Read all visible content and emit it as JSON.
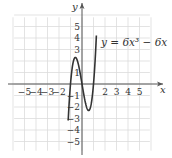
{
  "chart_data": {
    "type": "line",
    "title": "",
    "xlabel": "x",
    "ylabel": "y",
    "equation_label": "y = 6x³ − 6x",
    "function": "6x^3 - 6x",
    "xlim": [
      -6,
      6
    ],
    "ylim": [
      -6,
      6
    ],
    "grid": true,
    "x_ticks": [
      -5,
      -4,
      -3,
      -2,
      2,
      3,
      4,
      5
    ],
    "x_tick_labels": [
      "−5",
      "−4",
      "−3",
      "−2",
      "2",
      "3",
      "4",
      "5"
    ],
    "y_ticks": [
      5,
      4,
      3,
      1,
      -1,
      -2,
      -3,
      -4,
      -5
    ],
    "y_tick_labels": [
      "5",
      "4",
      "3",
      "1",
      "−1",
      "−2",
      "−3",
      "−4",
      "−5"
    ],
    "series": [
      {
        "name": "y = 6x^3 - 6x",
        "x": [
          -1.2,
          -1.1,
          -1.0,
          -0.9,
          -0.8,
          -0.7,
          -0.577,
          -0.5,
          -0.4,
          -0.3,
          -0.2,
          -0.1,
          0,
          0.1,
          0.2,
          0.3,
          0.4,
          0.5,
          0.577,
          0.7,
          0.8,
          0.9,
          1.0,
          1.1,
          1.2
        ],
        "values": [
          -3.17,
          -1.39,
          0,
          1.03,
          1.73,
          2.14,
          2.31,
          2.25,
          2.02,
          1.64,
          1.15,
          0.59,
          0,
          -0.59,
          -1.15,
          -1.64,
          -2.02,
          -2.25,
          -2.31,
          -2.14,
          -1.73,
          -1.03,
          0,
          1.39,
          3.17
        ]
      }
    ],
    "color": "#333333"
  }
}
